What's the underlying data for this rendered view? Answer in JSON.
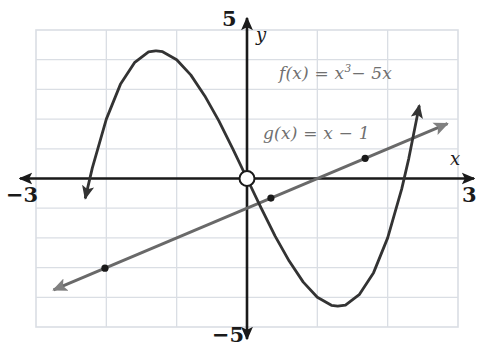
{
  "chart_data": {
    "type": "line",
    "title": "",
    "xlabel": "x",
    "ylabel": "y",
    "xlim": [
      -3,
      3
    ],
    "ylim": [
      -5,
      5
    ],
    "xticks": [
      -3,
      3
    ],
    "yticks": [
      -5,
      5
    ],
    "xtick_labels": [
      "−3",
      "3"
    ],
    "ytick_labels": [
      "−5",
      "5"
    ],
    "grid": true,
    "grid_step_x": 1,
    "grid_step_y": 1,
    "grid_color": "#d8dce2",
    "axis_color": "#1a1a1a",
    "legend": "inline-annotations",
    "series": [
      {
        "name": "f",
        "label": "f(x) = x³ − 5x",
        "expression": "x^3 - 5x",
        "color": "#333333",
        "kind": "cubic",
        "arrows": [
          "start",
          "end"
        ],
        "points": [
          {
            "x": -2.3,
            "y": -0.67
          },
          {
            "x": -2.2,
            "y": 0.35
          },
          {
            "x": -2.0,
            "y": 2.0
          },
          {
            "x": -1.8,
            "y": 3.17
          },
          {
            "x": -1.6,
            "y": 3.9
          },
          {
            "x": -1.4,
            "y": 4.26
          },
          {
            "x": -1.3,
            "y": 4.3
          },
          {
            "x": -1.29,
            "y": 4.3
          },
          {
            "x": -1.2,
            "y": 4.27
          },
          {
            "x": -1.0,
            "y": 4.0
          },
          {
            "x": -0.8,
            "y": 3.49
          },
          {
            "x": -0.6,
            "y": 2.78
          },
          {
            "x": -0.4,
            "y": 1.94
          },
          {
            "x": -0.2,
            "y": 0.99
          },
          {
            "x": 0.0,
            "y": 0.0
          },
          {
            "x": 0.2,
            "y": -0.99
          },
          {
            "x": 0.4,
            "y": -1.94
          },
          {
            "x": 0.6,
            "y": -2.78
          },
          {
            "x": 0.8,
            "y": -3.49
          },
          {
            "x": 1.0,
            "y": -4.0
          },
          {
            "x": 1.2,
            "y": -4.27
          },
          {
            "x": 1.29,
            "y": -4.3
          },
          {
            "x": 1.4,
            "y": -4.26
          },
          {
            "x": 1.6,
            "y": -3.9
          },
          {
            "x": 1.8,
            "y": -3.17
          },
          {
            "x": 2.0,
            "y": -2.0
          },
          {
            "x": 2.2,
            "y": -0.35
          },
          {
            "x": 2.3,
            "y": 0.67
          },
          {
            "x": 2.45,
            "y": 2.46
          }
        ],
        "local_max": {
          "x": -1.29,
          "y": 4.3
        },
        "local_min": {
          "x": 1.29,
          "y": -4.3
        },
        "roots": [
          -2.236,
          0,
          2.236
        ]
      },
      {
        "name": "g",
        "label": "g(x) = x − 1",
        "expression": "x - 1",
        "color": "#696969",
        "kind": "line",
        "slope": 1,
        "intercept": -1,
        "arrows": [
          "start",
          "end"
        ],
        "points": [
          {
            "x": -2.75,
            "y": -3.75
          },
          {
            "x": 2.85,
            "y": 1.85
          }
        ]
      }
    ],
    "markers": [
      {
        "name": "origin-marker",
        "x": 0,
        "y": 0,
        "style": "open-circle",
        "color": "#1a1a1a"
      },
      {
        "name": "intersection-left",
        "x": -2.02,
        "y": -3.02,
        "style": "filled-dot",
        "color": "#1a1a1a"
      },
      {
        "name": "intersection-middle",
        "x": 0.34,
        "y": -0.66,
        "style": "filled-dot",
        "color": "#1a1a1a"
      },
      {
        "name": "intersection-right",
        "x": 1.68,
        "y": 0.68,
        "style": "filled-dot",
        "color": "#1a1a1a"
      }
    ],
    "annotations": [
      {
        "name": "f-equation",
        "text": "f(x) = x³ − 5x",
        "x": 1.2,
        "y": 3.0
      },
      {
        "name": "g-equation",
        "text": "g(x) = x − 1",
        "x": 0.9,
        "y": 0.95
      }
    ]
  },
  "axes": {
    "x_label": "x",
    "y_label": "y",
    "x_min_tick": "−3",
    "x_max_tick": "3",
    "y_min_tick": "−5",
    "y_max_tick": "5"
  },
  "equations": {
    "f_prefix": "f(x) = x",
    "f_exponent": "3",
    "f_suffix": "− 5x",
    "g_text": "g(x) = x − 1"
  }
}
